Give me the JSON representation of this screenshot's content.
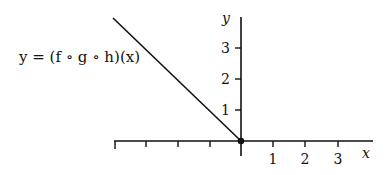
{
  "figure": {
    "formula": "y = (f ∘ g ∘ h)(x)",
    "x_axis_label": "x",
    "y_axis_label": "y",
    "x_tick_labels": [
      "1",
      "2",
      "3"
    ],
    "y_tick_labels": [
      "1",
      "2",
      "3"
    ],
    "x_range": [
      -4,
      3.8
    ],
    "y_range": [
      0,
      4
    ],
    "curve": {
      "description": "line with slope -1 for x <= 0, ending at origin with a filled dot",
      "points": [
        [
          -4,
          4
        ],
        [
          0,
          0
        ]
      ],
      "endpoint_dot": [
        0,
        0
      ]
    },
    "colors": {
      "stroke": "#111111",
      "background": "#ffffff"
    }
  }
}
